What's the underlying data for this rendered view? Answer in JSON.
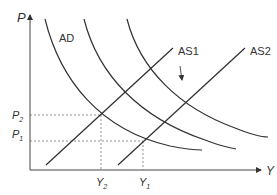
{
  "diagram": {
    "axes": {
      "y_label": "P",
      "x_label": "Y"
    },
    "curves": {
      "ad_label": "AD",
      "as1_label": "AS1",
      "as2_label": "AS2"
    },
    "price_levels": {
      "p2": {
        "main": "P",
        "sub": "2"
      },
      "p1": {
        "main": "P",
        "sub": "1"
      }
    },
    "output_levels": {
      "y2": {
        "main": "Y",
        "sub": "2"
      },
      "y1": {
        "main": "Y",
        "sub": "1"
      }
    },
    "annotation": "downward shift arrow",
    "colors": {
      "line": "#333333",
      "dashed": "#777777"
    }
  }
}
